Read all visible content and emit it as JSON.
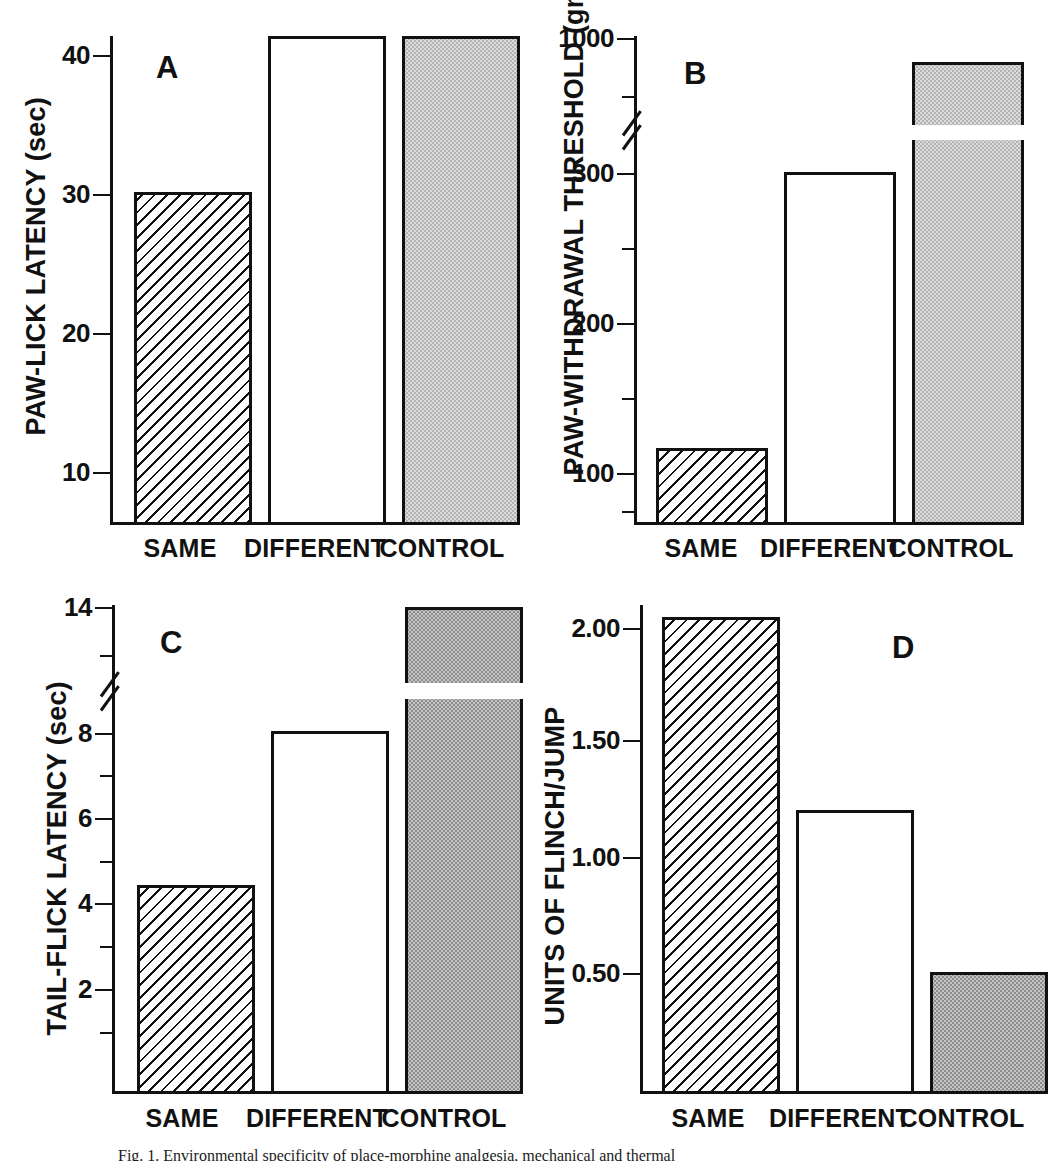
{
  "figure": {
    "caption": "Fig. 1.  Environmental specificity of place-morphine analgesia, mechanical and thermal"
  },
  "categories": [
    "SAME",
    "DIFFERENT",
    "CONTROL"
  ],
  "chart_data": [
    {
      "type": "bar",
      "panel": "A",
      "title": "",
      "ylabel": "PAW-LICK LATENCY (sec)",
      "xlabel": "",
      "categories": [
        "SAME",
        "DIFFERENT",
        "CONTROL"
      ],
      "values": [
        18.1,
        38.8,
        39.8
      ],
      "bar_styles": [
        "hatch",
        "white",
        "stip-light"
      ],
      "ylim": [
        6.6,
        41.6
      ],
      "ticks_major": [
        10,
        20,
        30,
        40
      ],
      "ticks_minor": [],
      "tick_labels": [
        "10",
        "20",
        "30",
        "40"
      ],
      "axis_break": false,
      "grid": false,
      "legend": "none"
    },
    {
      "type": "bar",
      "panel": "B",
      "title": "",
      "ylabel": "PAW-WITHDRAWAL THRESHOLD (gm)",
      "xlabel": "",
      "categories": [
        "SAME",
        "DIFFERENT",
        "CONTROL"
      ],
      "values": [
        118,
        315,
        800
      ],
      "bar_styles": [
        "hatch",
        "white",
        "stip-light"
      ],
      "ylim": [
        20,
        1000
      ],
      "ticks_major": [
        100,
        200,
        300,
        1000
      ],
      "ticks_minor": [
        50,
        150,
        250,
        650
      ],
      "tick_labels": [
        "100",
        "200",
        "300",
        "1000"
      ],
      "axis_break": true,
      "axis_break_between": [
        330,
        600
      ],
      "grid": false,
      "legend": "none"
    },
    {
      "type": "bar",
      "panel": "C",
      "title": "",
      "ylabel": "TAIL-FLICK LATENCY (sec)",
      "xlabel": "",
      "categories": [
        "SAME",
        "DIFFERENT",
        "CONTROL"
      ],
      "values": [
        4.35,
        8.0,
        14.0
      ],
      "bar_styles": [
        "hatch",
        "white",
        "stip-dark"
      ],
      "ylim": [
        0.4,
        14.3
      ],
      "ticks_major": [
        2,
        4,
        6,
        8,
        14
      ],
      "ticks_minor": [
        1,
        3,
        5,
        7,
        13
      ],
      "tick_labels": [
        "2",
        "4",
        "6",
        "8",
        "14"
      ],
      "axis_break": true,
      "axis_break_between": [
        8.6,
        12.6
      ],
      "grid": false,
      "legend": "none"
    },
    {
      "type": "bar",
      "panel": "D",
      "title": "",
      "ylabel": "UNITS OF FLINCH/JUMP",
      "xlabel": "",
      "categories": [
        "SAME",
        "DIFFERENT",
        "CONTROL"
      ],
      "values": [
        2.08,
        1.25,
        0.51
      ],
      "bar_styles": [
        "hatch",
        "white",
        "stip-dark"
      ],
      "ylim": [
        0.05,
        2.14
      ],
      "ticks_major": [
        0.5,
        1.0,
        1.5,
        2.0
      ],
      "ticks_minor": [],
      "tick_labels": [
        "0.50",
        "1.00",
        "1.50",
        "2.00"
      ],
      "axis_break": false,
      "grid": false,
      "legend": "none"
    }
  ],
  "panels": {
    "a": {
      "letter": "A",
      "ylabel": "PAW-LICK LATENCY (sec)",
      "tick_labels": [
        "40",
        "30",
        "20",
        "10"
      ],
      "cats": [
        "SAME",
        "DIFFERENT",
        "CONTROL"
      ]
    },
    "b": {
      "letter": "B",
      "ylabel": "PAW-WITHDRAWAL THRESHOLD (gm)",
      "tick_labels": [
        "1000",
        "300",
        "200",
        "100"
      ],
      "cats": [
        "SAME",
        "DIFFERENT",
        "CONTROL"
      ]
    },
    "c": {
      "letter": "C",
      "ylabel": "TAIL-FLICK LATENCY (sec)",
      "tick_labels": [
        "14",
        "8",
        "6",
        "4",
        "2"
      ],
      "cats": [
        "SAME",
        "DIFFERENT",
        "CONTROL"
      ]
    },
    "d": {
      "letter": "D",
      "ylabel": "UNITS OF FLINCH/JUMP",
      "tick_labels": [
        "2.00",
        "1.50",
        "1.00",
        "0.50"
      ],
      "cats": [
        "SAME",
        "DIFFERENT",
        "CONTROL"
      ]
    }
  }
}
